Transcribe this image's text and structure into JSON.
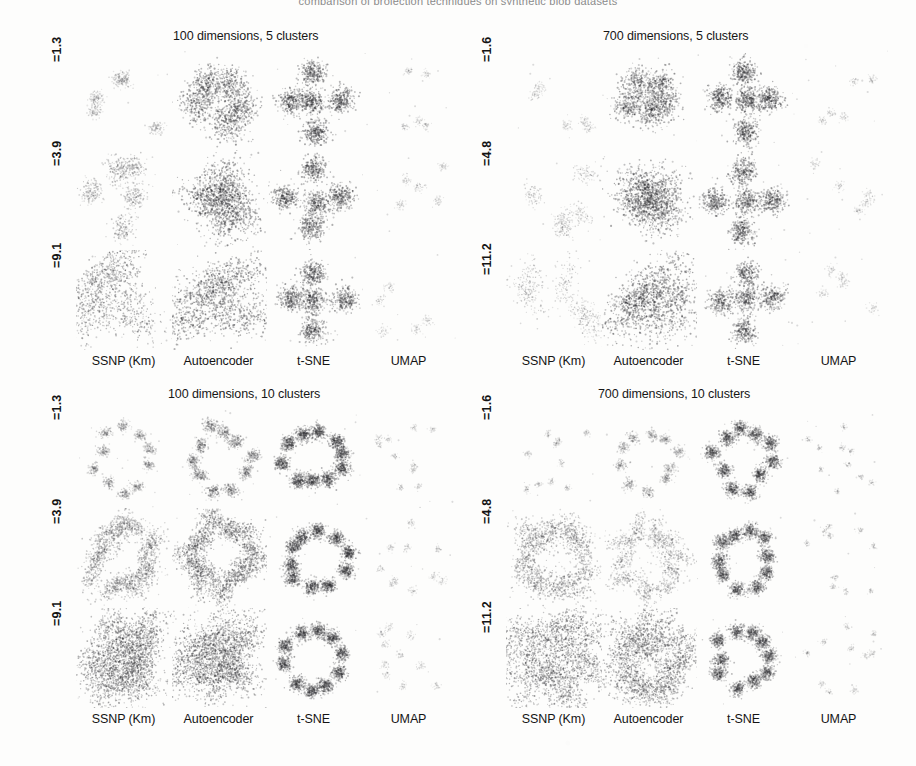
{
  "figure": {
    "clipped_top_caption": "comparison of projection techniques on synthetic blob datasets",
    "background_color": "#ffffff",
    "point_color": "#3a3a3a"
  },
  "column_labels": [
    "SSNP (Km)",
    "Autoencoder",
    "t-SNE",
    "UMAP"
  ],
  "blocks": [
    {
      "id": "top-left",
      "title": "100 dimensions, 5 clusters",
      "dimensions": 100,
      "clusters": 5,
      "row_labels": [
        "=1.3",
        "=3.9",
        "=9.1"
      ],
      "title_position": "above"
    },
    {
      "id": "top-right",
      "title": "700 dimensions, 5 clusters",
      "dimensions": 700,
      "clusters": 5,
      "row_labels": [
        "=1.6",
        "=4.8",
        "=11.2"
      ],
      "title_position": "above"
    },
    {
      "id": "bottom-left",
      "title": "100 dimensions, 10 clusters",
      "dimensions": 100,
      "clusters": 10,
      "row_labels": [
        "=1.3",
        "=3.9",
        "=9.1"
      ],
      "title_position": "above"
    },
    {
      "id": "bottom-right",
      "title": "700 dimensions, 10 clusters",
      "dimensions": 700,
      "clusters": 10,
      "row_labels": [
        "=1.6",
        "=4.8",
        "=11.2"
      ],
      "title_position": "above"
    }
  ],
  "chart_data": {
    "type": "scatter",
    "xlabel": "",
    "ylabel": "",
    "grid": false,
    "legend_position": "none",
    "columns": [
      "SSNP (Km)",
      "Autoencoder",
      "t-SNE",
      "UMAP"
    ],
    "row_variable": "cluster standard deviation",
    "panels": [
      {
        "block": "100 dimensions, 5 clusters",
        "dimensions": 100,
        "clusters": 5,
        "rows": [
          {
            "label": "=1.3",
            "noise": 1.3,
            "cells": [
              {
                "technique": "SSNP (Km)",
                "n_clusters": 5,
                "spread": 0.07,
                "point_size": 1.0,
                "density": 0.3,
                "elongation": 1.0,
                "layout": "scattered"
              },
              {
                "technique": "Autoencoder",
                "n_clusters": 5,
                "spread": 0.16,
                "point_size": 1.1,
                "density": 0.95,
                "elongation": 1.15,
                "layout": "compact"
              },
              {
                "technique": "t-SNE",
                "n_clusters": 5,
                "spread": 0.12,
                "point_size": 1.1,
                "density": 1.0,
                "elongation": 1.0,
                "layout": "cross"
              },
              {
                "technique": "UMAP",
                "n_clusters": 5,
                "spread": 0.04,
                "point_size": 0.9,
                "density": 0.13,
                "elongation": 1.0,
                "layout": "scattered"
              }
            ]
          },
          {
            "label": "=3.9",
            "noise": 3.9,
            "cells": [
              {
                "technique": "SSNP (Km)",
                "n_clusters": 5,
                "spread": 0.11,
                "point_size": 1.0,
                "density": 0.52,
                "elongation": 1.2,
                "layout": "scattered"
              },
              {
                "technique": "Autoencoder",
                "n_clusters": 5,
                "spread": 0.2,
                "point_size": 1.1,
                "density": 1.0,
                "elongation": 1.6,
                "layout": "compact"
              },
              {
                "technique": "t-SNE",
                "n_clusters": 5,
                "spread": 0.12,
                "point_size": 1.1,
                "density": 0.95,
                "elongation": 1.0,
                "layout": "cross"
              },
              {
                "technique": "UMAP",
                "n_clusters": 5,
                "spread": 0.05,
                "point_size": 0.9,
                "density": 0.14,
                "elongation": 1.0,
                "layout": "scattered"
              }
            ]
          },
          {
            "label": "=9.1",
            "noise": 9.1,
            "cells": [
              {
                "technique": "SSNP (Km)",
                "n_clusters": 5,
                "spread": 0.17,
                "point_size": 1.0,
                "density": 0.85,
                "elongation": 2.6,
                "layout": "scattered"
              },
              {
                "technique": "Autoencoder",
                "n_clusters": 5,
                "spread": 0.2,
                "point_size": 1.1,
                "density": 1.0,
                "elongation": 2.8,
                "layout": "star"
              },
              {
                "technique": "t-SNE",
                "n_clusters": 5,
                "spread": 0.12,
                "point_size": 1.1,
                "density": 0.95,
                "elongation": 1.0,
                "layout": "cross"
              },
              {
                "technique": "UMAP",
                "n_clusters": 5,
                "spread": 0.05,
                "point_size": 0.9,
                "density": 0.14,
                "elongation": 1.0,
                "layout": "scattered"
              }
            ]
          }
        ]
      },
      {
        "block": "700 dimensions, 5 clusters",
        "dimensions": 700,
        "clusters": 5,
        "rows": [
          {
            "label": "=1.6",
            "noise": 1.6,
            "cells": [
              {
                "technique": "SSNP (Km)",
                "n_clusters": 5,
                "spread": 0.05,
                "point_size": 0.9,
                "density": 0.15,
                "elongation": 1.1,
                "layout": "scattered"
              },
              {
                "technique": "Autoencoder",
                "n_clusters": 5,
                "spread": 0.14,
                "point_size": 1.1,
                "density": 0.88,
                "elongation": 1.1,
                "layout": "compact"
              },
              {
                "technique": "t-SNE",
                "n_clusters": 5,
                "spread": 0.12,
                "point_size": 1.1,
                "density": 1.0,
                "elongation": 1.0,
                "layout": "cross"
              },
              {
                "technique": "UMAP",
                "n_clusters": 5,
                "spread": 0.04,
                "point_size": 0.9,
                "density": 0.12,
                "elongation": 1.0,
                "layout": "scattered"
              }
            ]
          },
          {
            "label": "=4.8",
            "noise": 4.8,
            "cells": [
              {
                "technique": "SSNP (Km)",
                "n_clusters": 5,
                "spread": 0.08,
                "point_size": 0.9,
                "density": 0.3,
                "elongation": 1.6,
                "layout": "scattered"
              },
              {
                "technique": "Autoencoder",
                "n_clusters": 5,
                "spread": 0.19,
                "point_size": 1.1,
                "density": 1.0,
                "elongation": 1.4,
                "layout": "compact"
              },
              {
                "technique": "t-SNE",
                "n_clusters": 5,
                "spread": 0.12,
                "point_size": 1.1,
                "density": 0.95,
                "elongation": 1.0,
                "layout": "cross"
              },
              {
                "technique": "UMAP",
                "n_clusters": 5,
                "spread": 0.05,
                "point_size": 0.9,
                "density": 0.13,
                "elongation": 1.0,
                "layout": "scattered"
              }
            ]
          },
          {
            "label": "=11.2",
            "noise": 11.2,
            "cells": [
              {
                "technique": "SSNP (Km)",
                "n_clusters": 5,
                "spread": 0.1,
                "point_size": 0.9,
                "density": 0.4,
                "elongation": 2.4,
                "layout": "scattered"
              },
              {
                "technique": "Autoencoder",
                "n_clusters": 5,
                "spread": 0.2,
                "point_size": 1.1,
                "density": 1.0,
                "elongation": 2.2,
                "layout": "compact"
              },
              {
                "technique": "t-SNE",
                "n_clusters": 5,
                "spread": 0.12,
                "point_size": 1.1,
                "density": 0.9,
                "elongation": 1.0,
                "layout": "cross"
              },
              {
                "technique": "UMAP",
                "n_clusters": 5,
                "spread": 0.05,
                "point_size": 0.9,
                "density": 0.13,
                "elongation": 1.0,
                "layout": "scattered"
              }
            ]
          }
        ]
      },
      {
        "block": "100 dimensions, 10 clusters",
        "dimensions": 100,
        "clusters": 10,
        "rows": [
          {
            "label": "=1.3",
            "noise": 1.3,
            "cells": [
              {
                "technique": "SSNP (Km)",
                "n_clusters": 10,
                "spread": 0.05,
                "point_size": 1.0,
                "density": 0.35,
                "elongation": 1.2,
                "layout": "ring"
              },
              {
                "technique": "Autoencoder",
                "n_clusters": 10,
                "spread": 0.06,
                "point_size": 1.0,
                "density": 0.5,
                "elongation": 1.3,
                "layout": "ring"
              },
              {
                "technique": "t-SNE",
                "n_clusters": 10,
                "spread": 0.07,
                "point_size": 1.05,
                "density": 0.8,
                "elongation": 1.0,
                "layout": "ring"
              },
              {
                "technique": "UMAP",
                "n_clusters": 10,
                "spread": 0.03,
                "point_size": 0.9,
                "density": 0.1,
                "elongation": 1.0,
                "layout": "scattered"
              }
            ]
          },
          {
            "label": "=3.9",
            "noise": 3.9,
            "cells": [
              {
                "technique": "SSNP (Km)",
                "n_clusters": 10,
                "spread": 0.09,
                "point_size": 1.0,
                "density": 0.62,
                "elongation": 2.0,
                "layout": "ring"
              },
              {
                "technique": "Autoencoder",
                "n_clusters": 10,
                "spread": 0.1,
                "point_size": 1.0,
                "density": 0.8,
                "elongation": 2.2,
                "layout": "ring"
              },
              {
                "technique": "t-SNE",
                "n_clusters": 10,
                "spread": 0.07,
                "point_size": 1.05,
                "density": 0.78,
                "elongation": 1.0,
                "layout": "ring"
              },
              {
                "technique": "UMAP",
                "n_clusters": 10,
                "spread": 0.04,
                "point_size": 0.9,
                "density": 0.11,
                "elongation": 1.0,
                "layout": "scattered"
              }
            ]
          },
          {
            "label": "=9.1",
            "noise": 9.1,
            "cells": [
              {
                "technique": "SSNP (Km)",
                "n_clusters": 10,
                "spread": 0.15,
                "point_size": 1.0,
                "density": 0.92,
                "elongation": 3.0,
                "layout": "star"
              },
              {
                "technique": "Autoencoder",
                "n_clusters": 10,
                "spread": 0.15,
                "point_size": 1.0,
                "density": 0.92,
                "elongation": 3.0,
                "layout": "star"
              },
              {
                "technique": "t-SNE",
                "n_clusters": 10,
                "spread": 0.07,
                "point_size": 1.05,
                "density": 0.78,
                "elongation": 1.0,
                "layout": "ring"
              },
              {
                "technique": "UMAP",
                "n_clusters": 10,
                "spread": 0.04,
                "point_size": 0.9,
                "density": 0.11,
                "elongation": 1.0,
                "layout": "scattered"
              }
            ]
          }
        ]
      },
      {
        "block": "700 dimensions, 10 clusters",
        "dimensions": 700,
        "clusters": 10,
        "rows": [
          {
            "label": "=1.6",
            "noise": 1.6,
            "cells": [
              {
                "technique": "SSNP (Km)",
                "n_clusters": 10,
                "spread": 0.03,
                "point_size": 0.9,
                "density": 0.12,
                "elongation": 1.1,
                "layout": "scattered"
              },
              {
                "technique": "Autoencoder",
                "n_clusters": 10,
                "spread": 0.05,
                "point_size": 1.0,
                "density": 0.3,
                "elongation": 1.2,
                "layout": "ring"
              },
              {
                "technique": "t-SNE",
                "n_clusters": 10,
                "spread": 0.07,
                "point_size": 1.05,
                "density": 0.72,
                "elongation": 1.0,
                "layout": "ring"
              },
              {
                "technique": "UMAP",
                "n_clusters": 10,
                "spread": 0.03,
                "point_size": 0.9,
                "density": 0.1,
                "elongation": 1.0,
                "layout": "scattered"
              }
            ]
          },
          {
            "label": "=4.8",
            "noise": 4.8,
            "cells": [
              {
                "technique": "SSNP (Km)",
                "n_clusters": 10,
                "spread": 0.1,
                "point_size": 1.0,
                "density": 0.6,
                "elongation": 2.6,
                "layout": "ring"
              },
              {
                "technique": "Autoencoder",
                "n_clusters": 10,
                "spread": 0.08,
                "point_size": 1.0,
                "density": 0.45,
                "elongation": 2.0,
                "layout": "ring"
              },
              {
                "technique": "t-SNE",
                "n_clusters": 10,
                "spread": 0.07,
                "point_size": 1.05,
                "density": 0.72,
                "elongation": 1.0,
                "layout": "ring"
              },
              {
                "technique": "UMAP",
                "n_clusters": 10,
                "spread": 0.03,
                "point_size": 0.9,
                "density": 0.1,
                "elongation": 1.0,
                "layout": "scattered"
              }
            ]
          },
          {
            "label": "=11.2",
            "noise": 11.2,
            "cells": [
              {
                "technique": "SSNP (Km)",
                "n_clusters": 10,
                "spread": 0.14,
                "point_size": 1.0,
                "density": 0.88,
                "elongation": 3.2,
                "layout": "ring"
              },
              {
                "technique": "Autoencoder",
                "n_clusters": 10,
                "spread": 0.13,
                "point_size": 1.0,
                "density": 0.85,
                "elongation": 2.4,
                "layout": "ring"
              },
              {
                "technique": "t-SNE",
                "n_clusters": 10,
                "spread": 0.07,
                "point_size": 1.05,
                "density": 0.72,
                "elongation": 1.0,
                "layout": "ring"
              },
              {
                "technique": "UMAP",
                "n_clusters": 10,
                "spread": 0.03,
                "point_size": 0.9,
                "density": 0.1,
                "elongation": 1.0,
                "layout": "scattered"
              }
            ]
          }
        ]
      }
    ]
  }
}
